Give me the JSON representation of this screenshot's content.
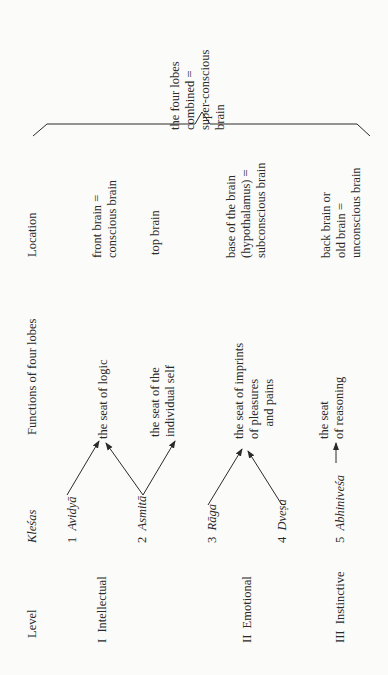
{
  "table": {
    "headers": {
      "level": "Level",
      "klesas": "Kleśas",
      "functions": "Functions of four lobes",
      "location": "Location"
    },
    "levels": [
      {
        "label": "I  Intellectual"
      },
      {
        "label": "II  Emotional"
      },
      {
        "label": "III  Instinctive"
      }
    ],
    "klesas": [
      {
        "number": "1",
        "name": "Avidyā"
      },
      {
        "number": "2",
        "name": "Asmitā"
      },
      {
        "number": "3",
        "name": "Rāga"
      },
      {
        "number": "4",
        "name": "Dveṣa"
      },
      {
        "number": "5",
        "name": "Abhiniveśa"
      }
    ],
    "functions": [
      {
        "text": "the seat of logic"
      },
      {
        "text": "the seat of the\nindividual self"
      },
      {
        "text": "the seat of imprints\nof pleasures\n    and pains"
      },
      {
        "text": "the seat\nof reasoning"
      }
    ],
    "locations": [
      {
        "text": "front brain =\nconscious brain"
      },
      {
        "text": "top brain"
      },
      {
        "text": "base of the brain\n(hypothalamus) =\nsubconscious brain"
      },
      {
        "text": "back brain or\nold brain =\nunconscious brain"
      }
    ],
    "combined": {
      "text": "the four lobes\ncombined =\nsuper-conscious\nbrain"
    }
  },
  "colors": {
    "ink": "#2a2a2a",
    "paper": "#fbfbf9"
  }
}
